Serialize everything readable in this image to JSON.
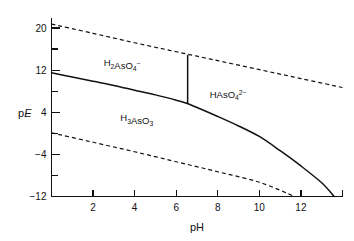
{
  "chart_data": {
    "type": "line",
    "title": "",
    "xlabel": "pH",
    "ylabel": "pE",
    "xlim": [
      0,
      14
    ],
    "ylim": [
      -12,
      22
    ],
    "grid": false,
    "legend": null,
    "xticks": [
      0,
      2,
      4,
      6,
      8,
      10,
      12,
      14
    ],
    "xtick_labels": [
      "",
      "2",
      "4",
      "6",
      "8",
      "10",
      "12",
      ""
    ],
    "yticks": [
      -12,
      -8,
      -4,
      0,
      4,
      8,
      12,
      16,
      20
    ],
    "ytick_labels": [
      "-12",
      "",
      "-4",
      "",
      "4",
      "",
      "12",
      "",
      "20"
    ],
    "series": [
      {
        "name": "water-oxidation-upper-boundary",
        "style": "dashed",
        "points": [
          [
            0.0,
            20.75
          ],
          [
            2.0,
            19.0
          ],
          [
            4.0,
            17.2
          ],
          [
            6.0,
            15.5
          ],
          [
            8.0,
            13.8
          ],
          [
            10.0,
            12.1
          ],
          [
            12.0,
            10.4
          ],
          [
            14.0,
            8.7
          ]
        ]
      },
      {
        "name": "water-reduction-lower-boundary",
        "style": "dashed",
        "points": [
          [
            0.0,
            0.1
          ],
          [
            2.0,
            -1.7
          ],
          [
            4.0,
            -3.5
          ],
          [
            6.0,
            -5.4
          ],
          [
            8.0,
            -7.3
          ],
          [
            10.0,
            -9.3
          ],
          [
            11.7,
            -12.0
          ]
        ]
      },
      {
        "name": "arsenate-arsenite-redox-boundary",
        "style": "solid",
        "points": [
          [
            0.0,
            11.5
          ],
          [
            1.0,
            10.7
          ],
          [
            2.0,
            9.9
          ],
          [
            3.0,
            9.1
          ],
          [
            4.0,
            8.2
          ],
          [
            5.0,
            7.3
          ],
          [
            6.0,
            6.3
          ],
          [
            6.5,
            5.7
          ],
          [
            7.0,
            4.9
          ],
          [
            8.0,
            3.2
          ],
          [
            9.0,
            1.4
          ],
          [
            10.0,
            -0.6
          ],
          [
            11.0,
            -3.3
          ],
          [
            12.0,
            -6.2
          ],
          [
            13.0,
            -9.4
          ],
          [
            13.6,
            -12.0
          ]
        ]
      },
      {
        "name": "arsenate-speciation-divider",
        "style": "solid-vertical",
        "points": [
          [
            6.55,
            14.9
          ],
          [
            6.55,
            5.6
          ]
        ]
      }
    ],
    "annotations": [
      {
        "name": "h2aso4-minus",
        "x": 3.4,
        "y": 12.7,
        "formula": [
          {
            "t": "H",
            "k": "n"
          },
          {
            "t": "2",
            "k": "sub"
          },
          {
            "t": "AsO",
            "k": "n"
          },
          {
            "t": "4",
            "k": "sub"
          },
          {
            "t": "−",
            "k": "sup"
          }
        ]
      },
      {
        "name": "haso4-2minus",
        "x": 8.5,
        "y": 6.8,
        "formula": [
          {
            "t": "HAsO",
            "k": "n"
          },
          {
            "t": "4",
            "k": "sub"
          },
          {
            "t": "2−",
            "k": "sup"
          }
        ]
      },
      {
        "name": "h3aso3",
        "x": 4.1,
        "y": 2.3,
        "formula": [
          {
            "t": "H",
            "k": "n"
          },
          {
            "t": "3",
            "k": "sub"
          },
          {
            "t": "AsO",
            "k": "n"
          },
          {
            "t": "3",
            "k": "sub"
          }
        ]
      }
    ]
  },
  "axes": {
    "y_title_prefix": "p",
    "y_title_italic": "E",
    "x_title": "pH"
  },
  "colors": {
    "ink": "#111111",
    "background": "#ffffff"
  }
}
